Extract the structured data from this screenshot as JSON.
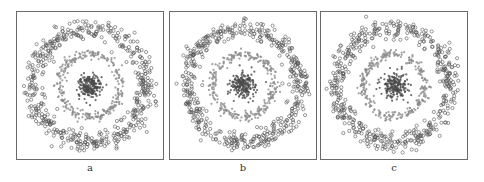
{
  "chart_data": [
    {
      "type": "scatter",
      "title": "",
      "caption": "a",
      "xlabel": "",
      "ylabel": "",
      "grid": false,
      "legend": "none",
      "series": [
        {
          "name": "outer ring",
          "shape": "ring",
          "radius": 0.92,
          "spread": 0.08,
          "n": 500,
          "marker": "open-circle",
          "color": "#555555"
        },
        {
          "name": "middle ring",
          "shape": "ring",
          "radius": 0.5,
          "spread": 0.04,
          "n": 300,
          "marker": "filled",
          "color": "#8a8a8a"
        },
        {
          "name": "center cluster",
          "shape": "blob",
          "radius": 0.0,
          "spread": 0.1,
          "n": 200,
          "marker": "filled",
          "color": "#4a4a4a"
        }
      ]
    },
    {
      "type": "scatter",
      "title": "",
      "caption": "b",
      "xlabel": "",
      "ylabel": "",
      "grid": false,
      "legend": "none",
      "series": [
        {
          "name": "outer ring",
          "shape": "ring",
          "radius": 0.92,
          "spread": 0.08,
          "n": 500,
          "marker": "open-circle",
          "color": "#555555"
        },
        {
          "name": "middle ring",
          "shape": "ring",
          "radius": 0.5,
          "spread": 0.04,
          "n": 300,
          "marker": "filled",
          "color": "#8a8a8a"
        },
        {
          "name": "center cluster",
          "shape": "blob",
          "radius": 0.0,
          "spread": 0.1,
          "n": 200,
          "marker": "filled",
          "color": "#4a4a4a"
        }
      ]
    },
    {
      "type": "scatter",
      "title": "",
      "caption": "c",
      "xlabel": "",
      "ylabel": "",
      "grid": false,
      "legend": "none",
      "series": [
        {
          "name": "outer ring",
          "shape": "ring",
          "radius": 0.92,
          "spread": 0.08,
          "n": 500,
          "marker": "open-circle",
          "color": "#555555"
        },
        {
          "name": "middle ring",
          "shape": "ring",
          "radius": 0.5,
          "spread": 0.04,
          "n": 300,
          "marker": "filled",
          "color": "#8a8a8a"
        },
        {
          "name": "center cluster",
          "shape": "blob",
          "radius": 0.0,
          "spread": 0.1,
          "n": 200,
          "marker": "filled",
          "color": "#4a4a4a"
        }
      ]
    }
  ],
  "panels": [
    {
      "caption": "a"
    },
    {
      "caption": "b"
    },
    {
      "caption": "c"
    }
  ]
}
